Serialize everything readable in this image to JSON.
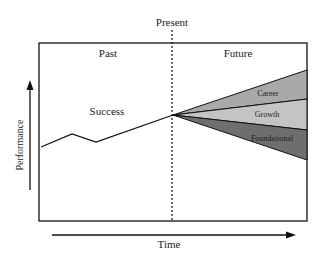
{
  "diagram": {
    "title_top": "Present",
    "regions": {
      "past": "Past",
      "future": "Future"
    },
    "axes": {
      "x_label": "Time",
      "y_label": "Performance"
    },
    "success_label": "Success",
    "fan_segments": [
      {
        "label": "Career",
        "color": "#a9a9a9"
      },
      {
        "label": "Growth",
        "color": "#c4c4c4"
      },
      {
        "label": "Foundational",
        "color": "#6e6e6e"
      }
    ],
    "colors": {
      "line": "#111111",
      "background": "#ffffff"
    }
  }
}
